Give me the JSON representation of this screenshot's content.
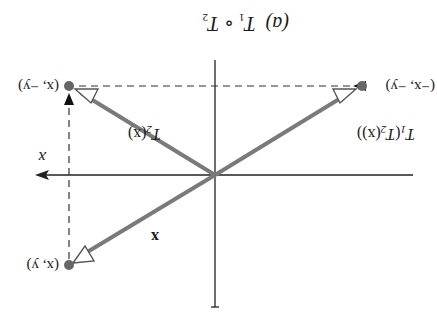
{
  "caption": {
    "part": "(a)",
    "expr_T1": "T",
    "expr_T1_sub": "1",
    "compose": "∘",
    "expr_T2": "T",
    "expr_T2_sub": "2"
  },
  "axes": {
    "x_label": "x",
    "color": "#222222"
  },
  "points": {
    "p_xy": "(x, y)",
    "p_x_negy": "(x, −y)",
    "p_negx_negy": "(−x, −y)"
  },
  "vectors": {
    "v_label": "x",
    "t2_label_T": "T",
    "t2_label_sub": "2",
    "t2_label_arg": "(x)",
    "t1t2_label_T": "T",
    "t1t2_label_sub1": "1",
    "t1t2_label_open": "(",
    "t1t2_label_T2": "T",
    "t1t2_label_sub2": "2",
    "t1t2_label_arg": "(x))",
    "color": "#7a7a7a"
  },
  "orientation": "rotated 180 degrees"
}
